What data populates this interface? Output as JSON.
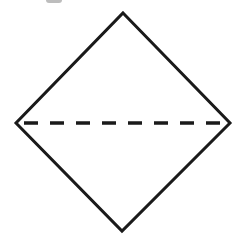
{
  "diagram": {
    "shape": "square-rotated-45 (rhombus)",
    "stroke_color": "#1a1a1a",
    "fill_color": "#ffffff",
    "background": "#ffffff",
    "stroke_width": 3,
    "vertices": {
      "top": [
        123,
        13
      ],
      "right": [
        230,
        123
      ],
      "bottom": [
        122,
        231
      ],
      "left": [
        16,
        123
      ]
    },
    "fold_line": {
      "style": "dashed",
      "from": "left",
      "to": "right",
      "dash": 14,
      "gap": 12
    },
    "top_edge_fragment_color": "#bdbdbd"
  }
}
